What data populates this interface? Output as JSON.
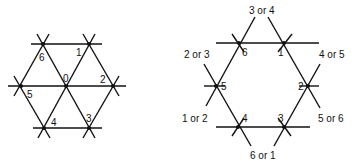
{
  "left_diagram": {
    "description": "Triangular lattice hexagon with center node",
    "nodes": [
      {
        "id": "0",
        "label": "0",
        "x": 66,
        "y": 86
      },
      {
        "id": "1",
        "label": "1",
        "x": 89,
        "y": 44
      },
      {
        "id": "2",
        "label": "2",
        "x": 113,
        "y": 86
      },
      {
        "id": "3",
        "label": "3",
        "x": 89,
        "y": 128
      },
      {
        "id": "4",
        "label": "4",
        "x": 44,
        "y": 128
      },
      {
        "id": "5",
        "label": "5",
        "x": 21,
        "y": 86
      },
      {
        "id": "6",
        "label": "6",
        "x": 43,
        "y": 44
      }
    ]
  },
  "right_diagram": {
    "description": "Hexagon of six nodes formed by intersecting lines, without center",
    "nodes": [
      {
        "id": "1",
        "label": "1",
        "x": 284,
        "y": 43
      },
      {
        "id": "2",
        "label": "2",
        "x": 308,
        "y": 86
      },
      {
        "id": "3",
        "label": "3",
        "x": 284,
        "y": 127
      },
      {
        "id": "4",
        "label": "4",
        "x": 238,
        "y": 127
      },
      {
        "id": "5",
        "label": "5",
        "x": 216,
        "y": 86
      },
      {
        "id": "6",
        "label": "6",
        "x": 239,
        "y": 43
      }
    ],
    "outer_labels": {
      "top": "3 or 4",
      "upper_right": "4 or 5",
      "lower_right": "5 or 6",
      "bottom": "6 or 1",
      "lower_left": "1 or 2",
      "upper_left": "2 or 3"
    }
  }
}
